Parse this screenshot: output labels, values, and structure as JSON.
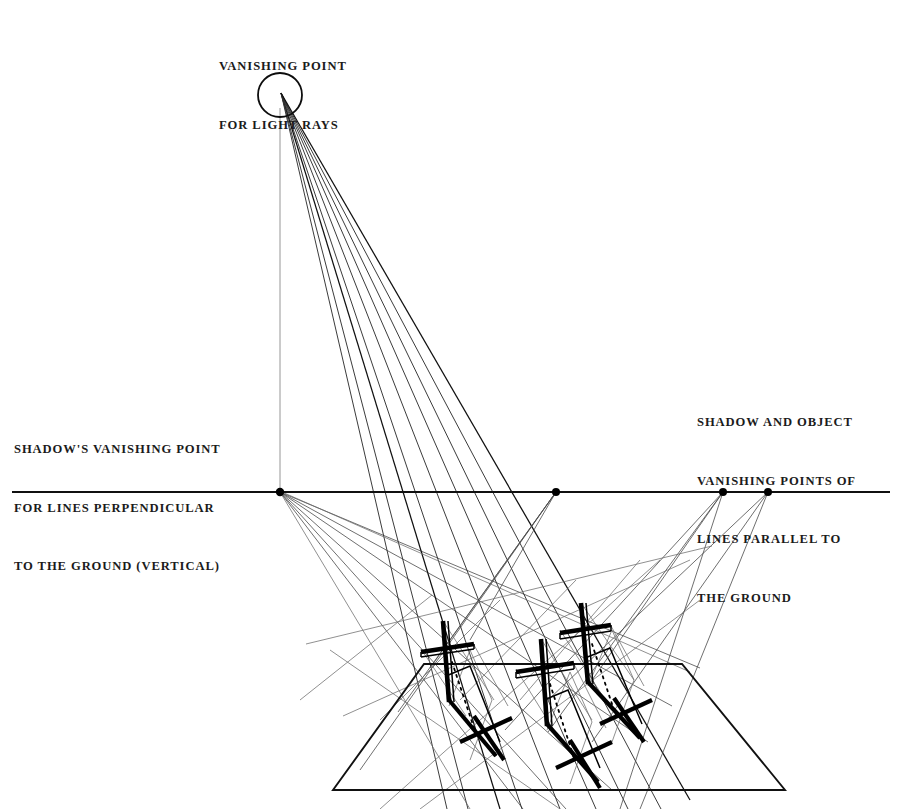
{
  "figure": {
    "background_color": "#ffffff",
    "ink_color": "#000000",
    "construction_line_color": "#4a4a4a"
  },
  "labels": {
    "sun_vp": {
      "name": "vanishing-point-for-light-rays",
      "lines": [
        "VANISHING POINT",
        "FOR LIGHT RAYS"
      ]
    },
    "left_vp": {
      "name": "shadows-vanishing-point-vertical",
      "lines": [
        "SHADOW'S VANISHING POINT",
        "FOR LINES PERPENDICULAR",
        "TO THE GROUND (VERTICAL)"
      ]
    },
    "right_vp": {
      "name": "shadow-and-object-vanishing-points",
      "lines": [
        "SHADOW AND OBJECT",
        "VANISHING POINTS OF",
        "LINES PARALLEL TO",
        "THE GROUND"
      ]
    }
  },
  "geometry": {
    "canvas": {
      "width": 901,
      "height": 809
    },
    "horizon": {
      "y": 492,
      "x_start": 12,
      "x_end": 890
    },
    "sun": {
      "cx": 280,
      "cy": 95,
      "r": 22,
      "ray_origin_x": 281,
      "ray_origin_y": 93
    },
    "vertical_drop_line": {
      "x": 280,
      "y_top": 108,
      "y_bottom": 492
    },
    "vanishing_points": [
      {
        "id": "vp-shadow-vertical",
        "x": 280,
        "y": 492
      },
      {
        "id": "vp-mid",
        "x": 556,
        "y": 492
      },
      {
        "id": "vp-right-a",
        "x": 723,
        "y": 492
      },
      {
        "id": "vp-right-b",
        "x": 768,
        "y": 492
      }
    ],
    "ground_plane": [
      {
        "x": 424,
        "y": 664
      },
      {
        "x": 682,
        "y": 664
      },
      {
        "x": 785,
        "y": 790
      },
      {
        "x": 333,
        "y": 790
      }
    ],
    "objects": [
      {
        "id": "cross-left",
        "post_top_x": 443,
        "post_top_y": 621,
        "post_bottom_x": 449,
        "post_bottom_y": 706,
        "bar_y": 649,
        "bar_left_x": 421,
        "bar_right_x": 474
      },
      {
        "id": "cross-middle",
        "post_top_x": 541,
        "post_top_y": 639,
        "post_bottom_x": 547,
        "post_bottom_y": 730,
        "bar_y": 669,
        "bar_left_x": 516,
        "bar_right_x": 574
      },
      {
        "id": "cross-right",
        "post_top_x": 581,
        "post_top_y": 603,
        "post_bottom_x": 588,
        "post_bottom_y": 686,
        "bar_y": 630,
        "bar_left_x": 560,
        "bar_right_x": 611
      }
    ],
    "ray_count": 9,
    "left_vp_fan_count": 6,
    "right_vp_fan_count": 5
  }
}
